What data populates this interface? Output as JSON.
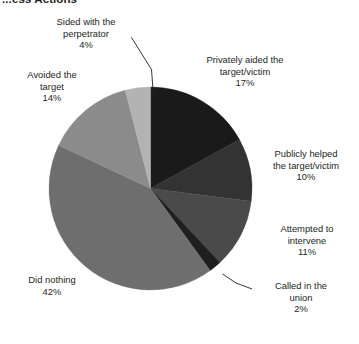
{
  "title": "...ess Actions",
  "chart_data": {
    "type": "pie",
    "title": "...ess Actions",
    "xlabel": "",
    "ylabel": "",
    "unit": "%",
    "legend_position": "none",
    "grid": false,
    "start_angle_deg": 0,
    "direction": "clockwise",
    "categories": [
      "Privately aided the target/victim",
      "Publicly helped the target/victim",
      "Attempted to intervene",
      "Called in the union",
      "Did nothing",
      "Avoided the target",
      "Sided with the perpetrator"
    ],
    "values": [
      17,
      10,
      11,
      2,
      42,
      14,
      4
    ],
    "colors": [
      "#1a1a1a",
      "#333333",
      "#4a4a4a",
      "#1f1f1f",
      "#6e6e6e",
      "#8b8b8b",
      "#b3b3b3"
    ],
    "slices": [
      {
        "name": "privately-aided",
        "label_line1": "Privately aided the",
        "label_line2": "target/victim",
        "percent_text": "17%",
        "value": 17,
        "color": "#1a1a1a",
        "leader_line": false
      },
      {
        "name": "publicly-helped",
        "label_line1": "Publicly helped",
        "label_line2": "the target/victim",
        "percent_text": "10%",
        "value": 10,
        "color": "#333333",
        "leader_line": false
      },
      {
        "name": "attempted-to-intervene",
        "label_line1": "Attempted to",
        "label_line2": "intervene",
        "percent_text": "11%",
        "value": 11,
        "color": "#4a4a4a",
        "leader_line": false
      },
      {
        "name": "called-in-the-union",
        "label_line1": "Called in the",
        "label_line2": "union",
        "percent_text": "2%",
        "value": 2,
        "color": "#1f1f1f",
        "leader_line": true
      },
      {
        "name": "did-nothing",
        "label_line1": "Did nothing",
        "label_line2": "",
        "percent_text": "42%",
        "value": 42,
        "color": "#6e6e6e",
        "leader_line": false
      },
      {
        "name": "avoided-the-target",
        "label_line1": "Avoided the",
        "label_line2": "target",
        "percent_text": "14%",
        "value": 14,
        "color": "#8b8b8b",
        "leader_line": false
      },
      {
        "name": "sided-with-the-perpetrator",
        "label_line1": "Sided with the",
        "label_line2": "perpetrator",
        "percent_text": "4%",
        "value": 4,
        "color": "#b3b3b3",
        "leader_line": true
      }
    ]
  }
}
